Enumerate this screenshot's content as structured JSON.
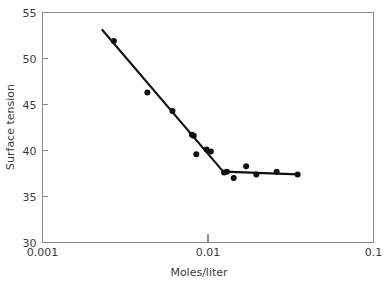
{
  "chart_data": {
    "type": "scatter",
    "title": "",
    "subtitle": "",
    "xlabel": "Moles/liter",
    "ylabel": "Surface tension",
    "xscale": "log",
    "yscale": "linear",
    "xlim": [
      0.001,
      0.1
    ],
    "ylim": [
      30,
      55
    ],
    "grid": false,
    "legend": null,
    "x_tick_labels": [
      "0.001",
      "0.01",
      "0.1"
    ],
    "x_tick_values": [
      0.001,
      0.01,
      0.1
    ],
    "y_tick_labels": [
      "30",
      "35",
      "40",
      "45",
      "50",
      "55"
    ],
    "y_tick_values": [
      30,
      35,
      40,
      45,
      50,
      55
    ],
    "series": [
      {
        "name": "Surface tension measurements",
        "type": "scatter",
        "marker": "filled-circle",
        "color": "#101010",
        "x": [
          0.0027,
          0.0043,
          0.0061,
          0.008,
          0.0082,
          0.0085,
          0.0098,
          0.0104,
          0.0125,
          0.013,
          0.0143,
          0.017,
          0.0196,
          0.026,
          0.0348
        ],
        "y": [
          51.9,
          46.3,
          44.3,
          41.7,
          41.6,
          39.6,
          40.1,
          39.9,
          37.6,
          37.7,
          37.0,
          38.3,
          37.4,
          37.7,
          37.4
        ]
      },
      {
        "name": "Fitted descending branch",
        "type": "line",
        "color": "#101010",
        "x": [
          0.0023,
          0.0125
        ],
        "y": [
          53.1,
          37.6
        ]
      },
      {
        "name": "Fitted plateau branch",
        "type": "line",
        "color": "#101010",
        "x": [
          0.0125,
          0.0348
        ],
        "y": [
          37.7,
          37.4
        ]
      }
    ],
    "annotations": []
  },
  "axes": {
    "y_axis_title": "Surface tension",
    "x_axis_title": "Moles/liter"
  },
  "colors": {
    "marker": "#101010",
    "line": "#101010",
    "spine": "#8a8a8a",
    "text": "#3b3b3b",
    "background": "#ffffff"
  }
}
